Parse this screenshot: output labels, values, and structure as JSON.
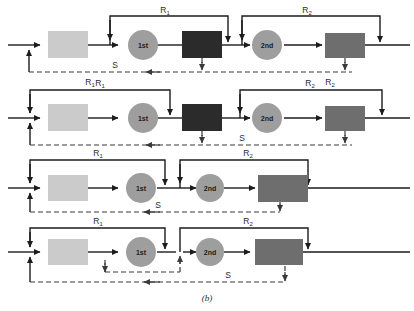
{
  "figure": {
    "caption": "(b)",
    "palette": {
      "line": "#1c1c1c",
      "dashed": "#3a3a3a",
      "box_light": "#cccccc",
      "box_dark": "#2e2e2e",
      "box_medium": "#6e6e6e",
      "circle": "#9a9a9a",
      "text": "#2b2b2b",
      "background": "#ffffff"
    },
    "labels": {
      "r1": "R",
      "r1_sub": "1",
      "r2": "R",
      "r2_sub": "2",
      "s": "S",
      "first": "1st",
      "second": "2nd"
    },
    "rows": [
      {
        "id": "row-1",
        "nodes": [
          {
            "name": "box-light",
            "type": "rect",
            "fill": "box_light"
          },
          {
            "name": "stage-1st",
            "type": "circle",
            "label": "1st"
          },
          {
            "name": "box-dark",
            "type": "rect",
            "fill": "box_dark"
          },
          {
            "name": "stage-2nd",
            "type": "circle",
            "label": "2nd"
          },
          {
            "name": "box-medium",
            "type": "rect",
            "fill": "box_medium"
          }
        ],
        "solid_loops": [
          "R1",
          "R2"
        ],
        "dashed_labels": [
          "S",
          "R1",
          "R2"
        ]
      },
      {
        "id": "row-2",
        "nodes": [
          {
            "name": "box-light",
            "type": "rect",
            "fill": "box_light"
          },
          {
            "name": "stage-1st",
            "type": "circle",
            "label": "1st"
          },
          {
            "name": "box-dark",
            "type": "rect",
            "fill": "box_dark"
          },
          {
            "name": "stage-2nd",
            "type": "circle",
            "label": "2nd"
          },
          {
            "name": "box-medium",
            "type": "rect",
            "fill": "box_medium"
          }
        ],
        "solid_loops": [
          "R1",
          "R2"
        ],
        "dashed_labels": [
          "S"
        ]
      },
      {
        "id": "row-3",
        "nodes": [
          {
            "name": "box-light",
            "type": "rect",
            "fill": "box_light"
          },
          {
            "name": "stage-1st",
            "type": "circle",
            "label": "1st"
          },
          {
            "name": "stage-2nd",
            "type": "circle",
            "label": "2nd"
          },
          {
            "name": "box-medium",
            "type": "rect",
            "fill": "box_medium"
          }
        ],
        "solid_loops": [
          "R1",
          "R2"
        ],
        "dashed_labels": [
          "S"
        ]
      },
      {
        "id": "row-4",
        "nodes": [
          {
            "name": "box-light",
            "type": "rect",
            "fill": "box_light"
          },
          {
            "name": "stage-1st",
            "type": "circle",
            "label": "1st"
          },
          {
            "name": "stage-2nd",
            "type": "circle",
            "label": "2nd"
          },
          {
            "name": "box-medium",
            "type": "rect",
            "fill": "box_medium"
          }
        ],
        "solid_loops": [
          "R1",
          "R2"
        ],
        "dashed_labels": [
          "S"
        ]
      }
    ]
  }
}
